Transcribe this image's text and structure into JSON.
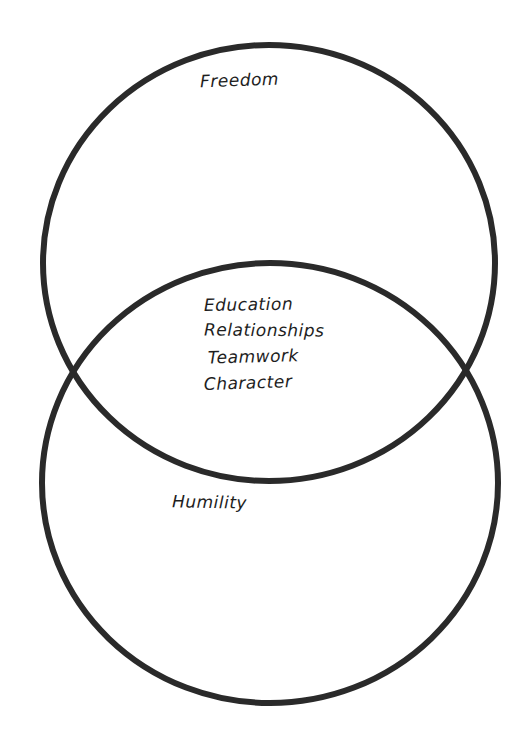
{
  "diagram": {
    "type": "venn",
    "style": "hand-drawn",
    "stroke_color": "#2a2a2a",
    "background": "#ffffff",
    "circles": [
      {
        "id": "top",
        "label": "Freedom",
        "cx": 269,
        "cy": 263,
        "rx": 226,
        "ry": 218
      },
      {
        "id": "bottom",
        "label": "Humility",
        "cx": 270,
        "cy": 483,
        "rx": 228,
        "ry": 220
      }
    ],
    "overlap": {
      "items": [
        "Education",
        "Relationships",
        "Teamwork",
        "Character"
      ]
    }
  }
}
